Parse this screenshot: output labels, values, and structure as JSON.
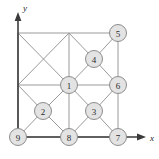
{
  "figure": {
    "title": "",
    "axes": {
      "x": {
        "label": "x",
        "arrow": "arrow-right",
        "label_x": 150,
        "label_y": 137
      },
      "y": {
        "label": "y",
        "arrow": "arrow-up",
        "label_x": 25,
        "label_y": 8
      }
    },
    "geometry": {
      "x_grid": [
        18,
        69,
        118
      ],
      "y_grid": [
        33,
        85,
        137
      ],
      "quadrant_centers": {
        "ul": [
          43,
          59
        ],
        "ur": [
          94,
          59
        ],
        "ll": [
          43,
          111
        ],
        "lr": [
          94,
          111
        ]
      }
    },
    "nodes": [
      {
        "id": "1",
        "label": "1",
        "x": 69,
        "y": 85,
        "r": 8.5
      },
      {
        "id": "2",
        "label": "2",
        "x": 43,
        "y": 111,
        "r": 8.5
      },
      {
        "id": "3",
        "label": "3",
        "x": 94,
        "y": 111,
        "r": 8.5
      },
      {
        "id": "4",
        "label": "4",
        "x": 94,
        "y": 59,
        "r": 8.5
      },
      {
        "id": "5",
        "label": "5",
        "x": 118,
        "y": 33,
        "r": 8.5
      },
      {
        "id": "6",
        "label": "6",
        "x": 118,
        "y": 85,
        "r": 8.5
      },
      {
        "id": "7",
        "label": "7",
        "x": 118,
        "y": 137,
        "r": 8.5
      },
      {
        "id": "8",
        "label": "8",
        "x": 69,
        "y": 137,
        "r": 8.5
      },
      {
        "id": "9",
        "label": "9",
        "x": 18,
        "y": 137,
        "r": 8.5
      }
    ],
    "edges": [
      {
        "x1": 18,
        "y1": 33,
        "x2": 118,
        "y2": 33
      },
      {
        "x1": 18,
        "y1": 85,
        "x2": 118,
        "y2": 85
      },
      {
        "x1": 18,
        "y1": 137,
        "x2": 118,
        "y2": 137
      },
      {
        "x1": 18,
        "y1": 33,
        "x2": 18,
        "y2": 137
      },
      {
        "x1": 69,
        "y1": 33,
        "x2": 69,
        "y2": 137
      },
      {
        "x1": 118,
        "y1": 33,
        "x2": 118,
        "y2": 137
      },
      {
        "x1": 18,
        "y1": 33,
        "x2": 69,
        "y2": 85
      },
      {
        "x1": 69,
        "y1": 33,
        "x2": 18,
        "y2": 85
      },
      {
        "x1": 69,
        "y1": 33,
        "x2": 94,
        "y2": 59
      },
      {
        "x1": 94,
        "y1": 59,
        "x2": 118,
        "y2": 33
      },
      {
        "x1": 118,
        "y1": 85,
        "x2": 94,
        "y2": 59
      },
      {
        "x1": 94,
        "y1": 59,
        "x2": 69,
        "y2": 85
      },
      {
        "x1": 18,
        "y1": 85,
        "x2": 43,
        "y2": 111
      },
      {
        "x1": 43,
        "y1": 111,
        "x2": 69,
        "y2": 85
      },
      {
        "x1": 69,
        "y1": 137,
        "x2": 43,
        "y2": 111
      },
      {
        "x1": 43,
        "y1": 111,
        "x2": 18,
        "y2": 137
      },
      {
        "x1": 69,
        "y1": 85,
        "x2": 94,
        "y2": 111
      },
      {
        "x1": 94,
        "y1": 111,
        "x2": 118,
        "y2": 85
      },
      {
        "x1": 118,
        "y1": 137,
        "x2": 94,
        "y2": 111
      },
      {
        "x1": 94,
        "y1": 111,
        "x2": 69,
        "y2": 137
      }
    ],
    "colors": {
      "edge": "#9a9a9a",
      "node_fill": "#e3e3e3",
      "node_stroke": "#8d8d8d",
      "axis": "#3b3b3b",
      "text": "#2a2a2a",
      "background": "#ffffff"
    }
  }
}
